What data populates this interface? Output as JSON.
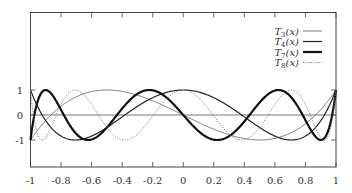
{
  "chart_data": {
    "type": "line",
    "title": "",
    "xlabel": "",
    "ylabel": "",
    "xlim": [
      -1,
      1
    ],
    "ylim": [
      -3,
      3.2
    ],
    "grid": false,
    "legend_position": "top-right",
    "x_ticks": [
      "-1",
      "-0.8",
      "-0.6",
      "-0.4",
      "-0.2",
      "0",
      "0.2",
      "0.4",
      "0.6",
      "0.8",
      "1"
    ],
    "x_tick_values": [
      -1,
      -0.8,
      -0.6,
      -0.4,
      -0.2,
      0,
      0.2,
      0.4,
      0.6,
      0.8,
      1
    ],
    "y_ticks": [
      "1",
      "0",
      "-1"
    ],
    "y_tick_values": [
      1,
      0,
      -1
    ],
    "series": [
      {
        "name": "T3(x)",
        "label_main": "T",
        "label_sub": "3",
        "label_arg": "(x)",
        "degree": 3,
        "style": "thin",
        "color": "#555555",
        "width": 0.8,
        "dash": ""
      },
      {
        "name": "T4(x)",
        "label_main": "T",
        "label_sub": "4",
        "label_arg": "(x)",
        "degree": 4,
        "style": "medium",
        "color": "#222222",
        "width": 1.2,
        "dash": ""
      },
      {
        "name": "T7(x)",
        "label_main": "T",
        "label_sub": "7",
        "label_arg": "(x)",
        "degree": 7,
        "style": "thick",
        "color": "#111111",
        "width": 2.2,
        "dash": ""
      },
      {
        "name": "T8(x)",
        "label_main": "T",
        "label_sub": "8",
        "label_arg": "(x)",
        "degree": 8,
        "style": "dotted",
        "color": "#777777",
        "width": 0.9,
        "dash": "1.2,1.4"
      }
    ],
    "sample_points": {
      "x": [
        -1,
        -0.8,
        -0.6,
        -0.4,
        -0.2,
        0,
        0.2,
        0.4,
        0.6,
        0.8,
        1
      ],
      "T3": [
        -1,
        0.352,
        0.936,
        0.944,
        0.568,
        0,
        -0.568,
        -0.944,
        -0.936,
        -0.352,
        1
      ],
      "T4": [
        1,
        -0.6928,
        -0.5392,
        0.3312,
        0.8528,
        1,
        0.8528,
        0.3312,
        -0.5392,
        -0.6928,
        1
      ],
      "T7": [
        -1,
        0.9565,
        -0.2178,
        -0.9705,
        0.9042,
        0,
        -0.9042,
        0.9705,
        0.2178,
        -0.9565,
        1
      ],
      "T8": [
        1,
        -0.4294,
        -0.7001,
        0.0871,
        0.9063,
        1,
        0.9063,
        0.0871,
        -0.7001,
        -0.4294,
        1
      ]
    }
  }
}
